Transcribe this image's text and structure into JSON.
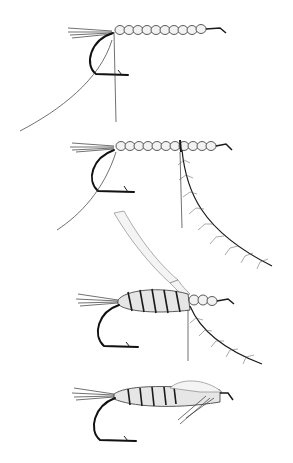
{
  "illustration": {
    "subject": "fly-tying steps",
    "stage_count": 4,
    "stages": [
      {
        "step": 1,
        "description": "hook with tail fibers and segmented bead body, thread and rib hanging"
      },
      {
        "step": 2,
        "description": "segmented body with hackle feather tied in at the middle"
      },
      {
        "step": 3,
        "description": "rear half wound with hairy dubbing ribbing, quill strip and hackle trailing"
      },
      {
        "step": 4,
        "description": "completed fly with wing case over thorax and legs"
      }
    ],
    "colors": {
      "background": "#ffffff",
      "ink": "#1a1a1a"
    }
  }
}
